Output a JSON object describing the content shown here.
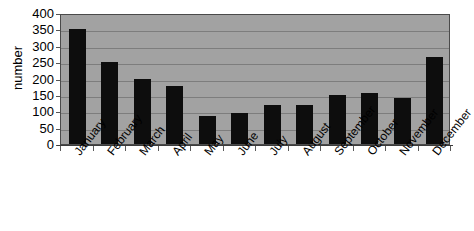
{
  "chart_data": {
    "type": "bar",
    "title": "",
    "xlabel": "",
    "ylabel": "number",
    "categories": [
      "January",
      "February",
      "March",
      "April",
      "May",
      "June",
      "July",
      "August",
      "September",
      "October",
      "November",
      "December"
    ],
    "values": [
      350,
      250,
      200,
      178,
      85,
      95,
      120,
      118,
      150,
      155,
      142,
      265
    ],
    "ylim": [
      0,
      400
    ],
    "ytick_values": [
      0,
      50,
      100,
      150,
      200,
      250,
      300,
      350,
      400
    ],
    "ytick_labels": [
      "0",
      "50",
      "100",
      "150",
      "200",
      "250",
      "300",
      "350",
      "400"
    ],
    "grid": true,
    "grid_axis": "y",
    "legend": false,
    "legend_position": "none",
    "series": [
      {
        "name": "number",
        "values": [
          350,
          250,
          200,
          178,
          85,
          95,
          120,
          118,
          150,
          155,
          142,
          265
        ]
      }
    ],
    "colors": {
      "bar": "#0d0d0d",
      "plot_background": "#a2a2a2",
      "gridline": "#7d7d7d",
      "axis": "#3b3b3b",
      "text": "#000000",
      "figure_background": "#ffffff"
    }
  }
}
